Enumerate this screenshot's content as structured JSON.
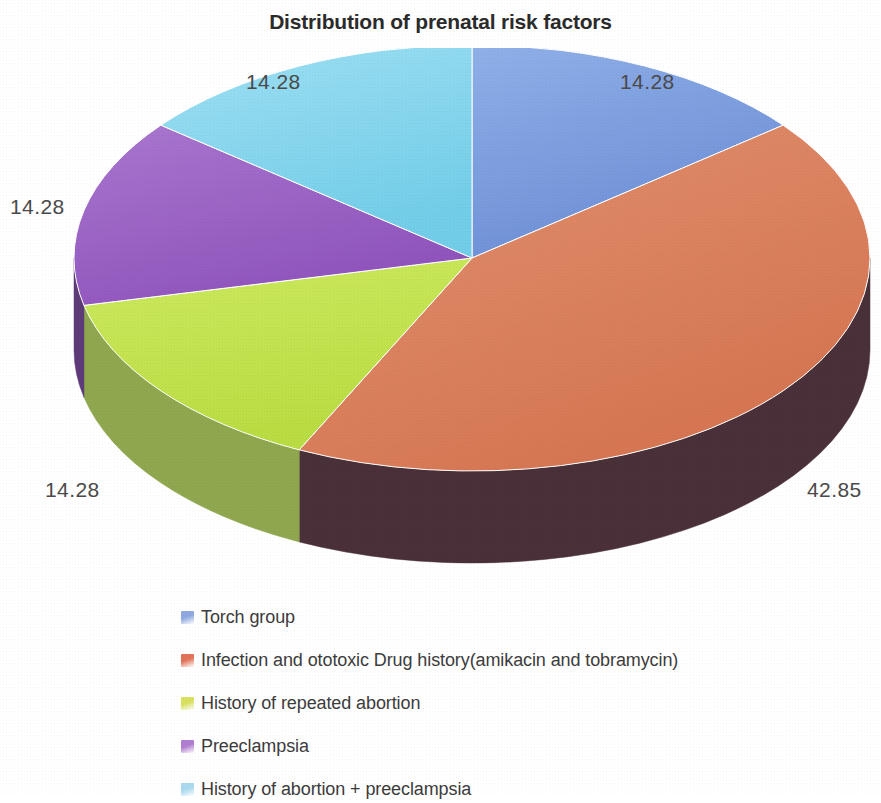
{
  "chart_data": {
    "type": "pie",
    "title": "Distribution of prenatal risk factors",
    "categories": [
      "Torch group",
      "Infection and ototoxic Drug history(amikacin and tobramycin)",
      "History of repeated abortion",
      "Preeclampsia",
      "History of abortion + preeclampsia"
    ],
    "values": [
      14.28,
      42.85,
      14.28,
      14.28,
      14.28
    ],
    "value_labels": [
      "14.28",
      "42.85",
      "14.28",
      "14.28",
      "14.28"
    ],
    "colors": [
      "#7f9fdd",
      "#da7f5e",
      "#c3e24f",
      "#9b62c7",
      "#86d8ef"
    ],
    "side_colors": [
      "#4c5f85",
      "#4a3038",
      "#8fa74e",
      "#5e3b78",
      "#4f8196"
    ],
    "legend_position": "bottom",
    "grid": false,
    "three_d": true,
    "start_angle_deg": 0,
    "direction": "clockwise",
    "xlabel": "",
    "ylabel": ""
  },
  "labels": [
    {
      "text": "14.28",
      "name": "data-label-torch-group",
      "left": 620,
      "top": 70
    },
    {
      "text": "42.85",
      "name": "data-label-infection-drug-history",
      "left": 807,
      "top": 478
    },
    {
      "text": "14.28",
      "name": "data-label-repeated-abortion",
      "left": 45,
      "top": 478
    },
    {
      "text": "14.28",
      "name": "data-label-preeclampsia",
      "left": 10,
      "top": 195
    },
    {
      "text": "14.28",
      "name": "data-label-abortion-preeclampsia",
      "left": 246,
      "top": 70
    }
  ],
  "legend": {
    "items": [
      {
        "label": "Torch group",
        "color": "#8fa9e0"
      },
      {
        "label": "Infection and ototoxic Drug history(amikacin and tobramycin)",
        "color": "#e2735a"
      },
      {
        "label": "History of repeated abortion",
        "color": "#d9e05e"
      },
      {
        "label": "Preeclampsia",
        "color": "#b07ed0"
      },
      {
        "label": "History of abortion + preeclampsia",
        "color": "#a9d9ee"
      }
    ]
  }
}
